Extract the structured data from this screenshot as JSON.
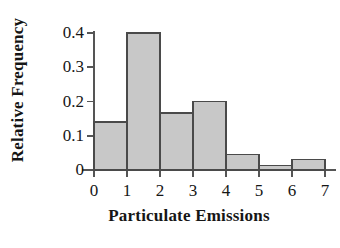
{
  "chart_data": {
    "type": "bar",
    "title": "",
    "xlabel": "Particulate Emissions",
    "ylabel": "Relative Frequency",
    "bin_edges": [
      0,
      1,
      2,
      3,
      4,
      5,
      6,
      7
    ],
    "categories": [
      "0-1",
      "1-2",
      "2-3",
      "3-4",
      "4-5",
      "5-6",
      "6-7"
    ],
    "values": [
      0.14,
      0.4,
      0.167,
      0.2,
      0.045,
      0.014,
      0.03
    ],
    "xlim": [
      0,
      7
    ],
    "ylim": [
      0,
      0.4
    ],
    "xticks": [
      "0",
      "1",
      "2",
      "3",
      "4",
      "5",
      "6",
      "7"
    ],
    "yticks": [
      "0",
      "0.1",
      "0.2",
      "0.3",
      "0.4"
    ],
    "ytick_values": [
      0,
      0.1,
      0.2,
      0.3,
      0.4
    ],
    "grid": false,
    "legend": false,
    "bar_fill_color": "#c8c8c8",
    "bar_edge_color": "#4a4a4a",
    "axis_color": "#555555",
    "background_color": "#ffffff"
  }
}
